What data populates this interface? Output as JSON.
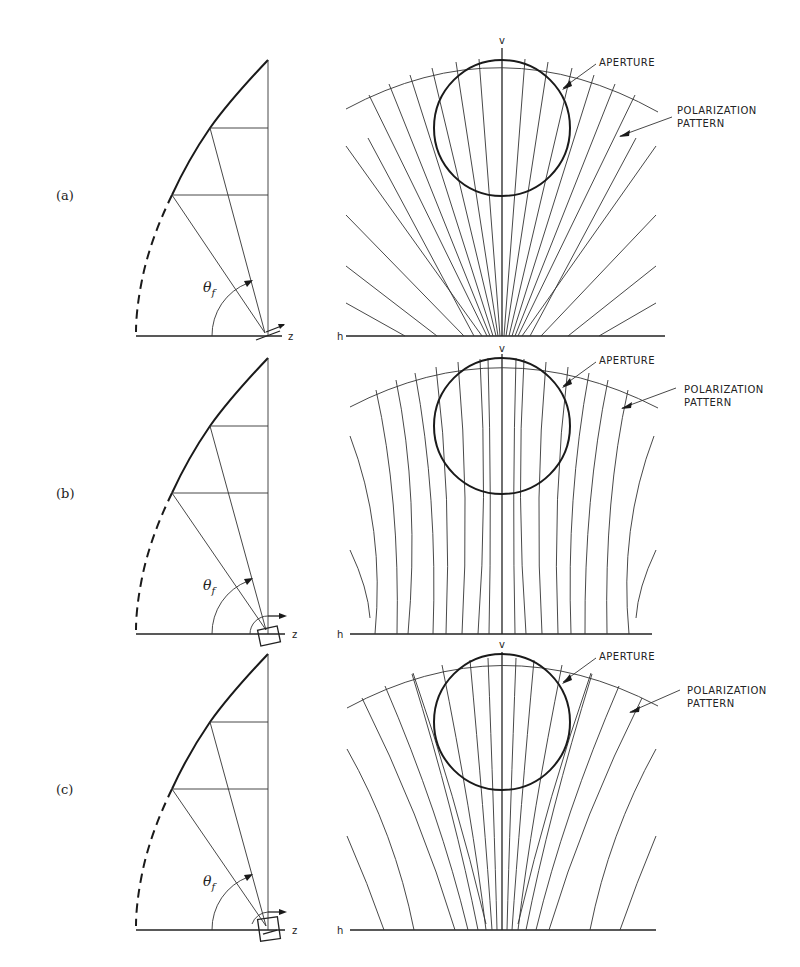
{
  "figure": {
    "panels": [
      {
        "id": "a",
        "label": "(a)",
        "feed_type": "dipole-like feed",
        "angle_label": "θ",
        "angle_subscript": "f",
        "axis_z": "z",
        "axis_h": "h",
        "axis_v": "v",
        "aperture_label": "APERTURE",
        "polarization_label_line1": "POLARIZATION",
        "polarization_label_line2": "PATTERN",
        "pattern_style": "radial-fan"
      },
      {
        "id": "b",
        "label": "(b)",
        "feed_type": "horn feed",
        "angle_label": "θ",
        "angle_subscript": "f",
        "axis_z": "z",
        "axis_h": "h",
        "axis_v": "v",
        "aperture_label": "APERTURE",
        "polarization_label_line1": "POLARIZATION",
        "polarization_label_line2": "PATTERN",
        "pattern_style": "near-vertical-curved"
      },
      {
        "id": "c",
        "label": "(c)",
        "feed_type": "horn feed with dipole",
        "angle_label": "θ",
        "angle_subscript": "f",
        "axis_z": "z",
        "axis_h": "h",
        "axis_v": "v",
        "aperture_label": "APERTURE",
        "polarization_label_line1": "POLARIZATION",
        "polarization_label_line2": "PATTERN",
        "pattern_style": "moderate-fan"
      }
    ],
    "colors": {
      "ink": "#1a1a1a",
      "background": "#ffffff"
    }
  }
}
